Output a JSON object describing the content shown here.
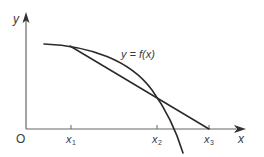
{
  "diagram": {
    "curve_label": "y = f(x)",
    "axes": {
      "origin_label": "O",
      "x_label": "x",
      "y_label": "y"
    },
    "x_ticks": [
      {
        "label": "x",
        "sub": "1"
      },
      {
        "label": "x",
        "sub": "2"
      },
      {
        "label": "x",
        "sub": "3"
      }
    ],
    "colors": {
      "stroke": "#2a2a2a",
      "axis": "#555555",
      "text": "#3a3a3a",
      "background": "#ffffff"
    }
  }
}
